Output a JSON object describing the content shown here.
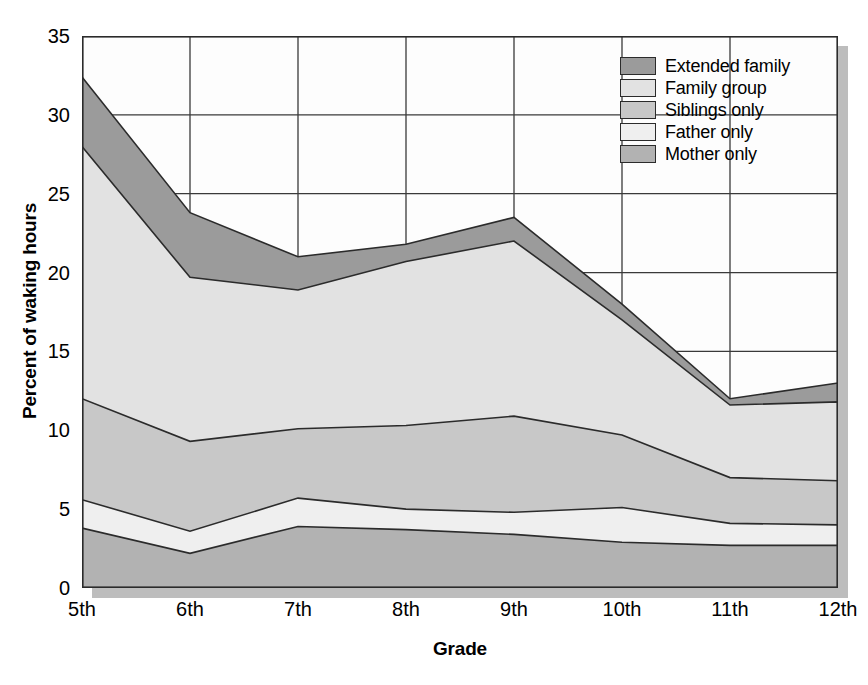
{
  "chart_data": {
    "type": "area",
    "title": "",
    "subtitle": "",
    "stacked": true,
    "xlabel": "Grade",
    "ylabel": "Percent of waking hours",
    "categories": [
      "5th",
      "6th",
      "7th",
      "8th",
      "9th",
      "10th",
      "11th",
      "12th"
    ],
    "ylim": [
      0,
      35
    ],
    "yticks": [
      0,
      5,
      10,
      15,
      20,
      25,
      30,
      35
    ],
    "grid": true,
    "legend_position": "top-right",
    "series": [
      {
        "name": "Mother only",
        "color": "#b2b2b2",
        "stack_order": 1,
        "values": [
          3.8,
          2.2,
          3.9,
          3.7,
          3.4,
          2.9,
          2.7,
          2.7
        ],
        "cumulative_top": [
          3.8,
          2.2,
          3.9,
          3.7,
          3.4,
          2.9,
          2.7,
          2.7
        ]
      },
      {
        "name": "Father only",
        "color": "#efefef",
        "stack_order": 2,
        "values": [
          1.8,
          1.4,
          1.8,
          1.3,
          1.4,
          2.2,
          1.4,
          1.3
        ],
        "cumulative_top": [
          5.6,
          3.6,
          5.7,
          5.0,
          4.8,
          5.1,
          4.1,
          4.0
        ]
      },
      {
        "name": "Siblings only",
        "color": "#c8c8c8",
        "stack_order": 3,
        "values": [
          6.4,
          5.7,
          4.4,
          5.3,
          6.1,
          4.6,
          2.9,
          2.8
        ],
        "cumulative_top": [
          12.0,
          9.3,
          10.1,
          10.3,
          10.9,
          9.7,
          7.0,
          6.8
        ]
      },
      {
        "name": "Family group",
        "color": "#e2e2e2",
        "stack_order": 4,
        "values": [
          16.0,
          10.4,
          8.8,
          10.4,
          11.1,
          7.3,
          4.6,
          5.0
        ],
        "cumulative_top": [
          28.0,
          19.7,
          18.9,
          20.7,
          22.0,
          17.0,
          11.6,
          11.8
        ]
      },
      {
        "name": "Extended family",
        "color": "#9b9b9b",
        "stack_order": 5,
        "values": [
          4.4,
          4.1,
          2.1,
          1.1,
          1.5,
          1.0,
          0.4,
          1.2
        ],
        "cumulative_top": [
          32.4,
          23.8,
          21.0,
          21.8,
          23.5,
          18.0,
          12.0,
          13.0
        ]
      }
    ],
    "legend_order": [
      "Extended family",
      "Family group",
      "Siblings only",
      "Father only",
      "Mother only"
    ]
  },
  "axes": {
    "y_title": "Percent of waking hours",
    "x_title": "Grade",
    "y_tick_labels": [
      "0",
      "5",
      "10",
      "15",
      "20",
      "25",
      "30",
      "35"
    ],
    "x_tick_labels": [
      "5th",
      "6th",
      "7th",
      "8th",
      "9th",
      "10th",
      "11th",
      "12th"
    ]
  },
  "legend": {
    "items": [
      {
        "label": "Extended family",
        "color": "#9b9b9b"
      },
      {
        "label": "Family group",
        "color": "#e2e2e2"
      },
      {
        "label": "Siblings only",
        "color": "#c8c8c8"
      },
      {
        "label": "Father only",
        "color": "#efefef"
      },
      {
        "label": "Mother only",
        "color": "#b2b2b2"
      }
    ]
  },
  "style": {
    "plot_background": "#fdfdfd",
    "gridline_color": "#3a3a3a",
    "outline_color": "#2b2b2b",
    "shadow_color": "#bdbdbd"
  }
}
